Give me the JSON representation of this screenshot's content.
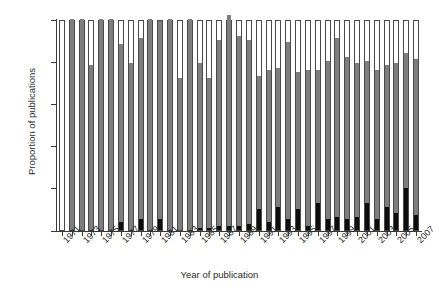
{
  "chart_data": {
    "type": "bar",
    "stacked": true,
    "stack_mode": "percent",
    "title": "",
    "xlabel": "Year of publication",
    "ylabel": "Proportion of publications",
    "ylim": [
      0,
      100
    ],
    "ytick_labels": [
      "0%",
      "20%",
      "40%",
      "60%",
      "80%",
      "100%"
    ],
    "ytick_values": [
      0,
      20,
      40,
      60,
      80,
      100
    ],
    "grid": false,
    "legend": "none",
    "categories": [
      "1971",
      "1972",
      "1973",
      "1974",
      "1975",
      "1976",
      "1977",
      "1978",
      "1979",
      "1980",
      "1981",
      "1982",
      "1983",
      "1984",
      "1985",
      "1986",
      "1987",
      "1988",
      "1989",
      "1990",
      "1991",
      "1992",
      "1993",
      "1994",
      "1995",
      "1996",
      "1997",
      "1998",
      "1999",
      "2000",
      "2001",
      "2002",
      "2003",
      "2004",
      "2005",
      "2006",
      "2007"
    ],
    "xtick_labels": [
      "1971",
      "1973",
      "1975",
      "1977",
      "1979",
      "1981",
      "1983",
      "1985",
      "1987",
      "1989",
      "1991",
      "1993",
      "1995",
      "1997",
      "1999",
      "2001",
      "2003",
      "2005",
      "2007"
    ],
    "series": [
      {
        "name": "lower-segment",
        "color": "#0d0d0d",
        "values": [
          0,
          0,
          0,
          0,
          0,
          0,
          4,
          0,
          5,
          0,
          5,
          0,
          0,
          0,
          1,
          1,
          2,
          2,
          2,
          3,
          10,
          4,
          11,
          5,
          10,
          2,
          13,
          5,
          6,
          5,
          6,
          13,
          5,
          11,
          8,
          20,
          7
        ]
      },
      {
        "name": "middle-segment",
        "color": "#7e7e7e",
        "values": [
          0,
          100,
          100,
          78,
          100,
          100,
          84,
          79,
          86,
          100,
          94,
          100,
          72,
          100,
          78,
          71,
          88,
          100,
          90,
          87,
          63,
          72,
          66,
          84,
          65,
          74,
          63,
          75,
          85,
          77,
          73,
          67,
          71,
          67,
          71,
          64,
          74
        ]
      },
      {
        "name": "upper-segment",
        "color": "#ffffff",
        "values": [
          100,
          0,
          0,
          22,
          0,
          0,
          12,
          21,
          9,
          0,
          1,
          0,
          28,
          0,
          21,
          28,
          10,
          0,
          8,
          10,
          27,
          24,
          23,
          11,
          25,
          24,
          24,
          20,
          9,
          18,
          21,
          20,
          24,
          22,
          21,
          16,
          19
        ]
      }
    ]
  }
}
